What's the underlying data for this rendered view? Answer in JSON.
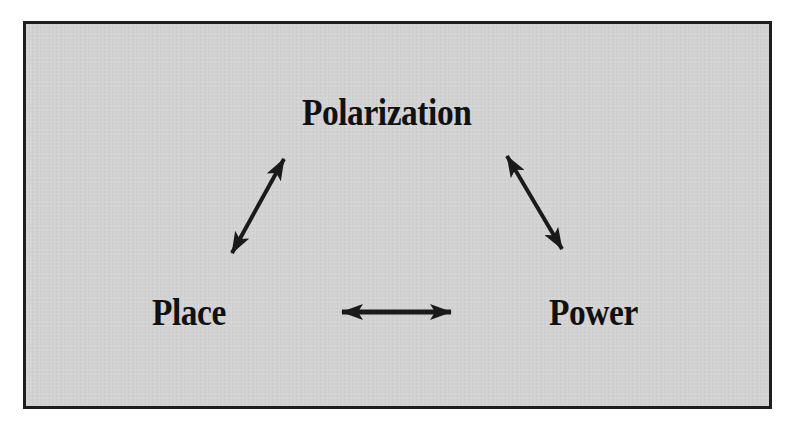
{
  "diagram": {
    "type": "triangle-relationship",
    "background_color": "#d3d3d3",
    "border_color": "#1e1e1e",
    "arrow_color": "#1a1a1a",
    "nodes": [
      {
        "id": "top",
        "label": "Polarization"
      },
      {
        "id": "left",
        "label": "Place"
      },
      {
        "id": "right",
        "label": "Power"
      }
    ],
    "edges": [
      {
        "from": "Polarization",
        "to": "Place",
        "direction": "bidirectional"
      },
      {
        "from": "Polarization",
        "to": "Power",
        "direction": "bidirectional"
      },
      {
        "from": "Place",
        "to": "Power",
        "direction": "bidirectional"
      }
    ]
  }
}
